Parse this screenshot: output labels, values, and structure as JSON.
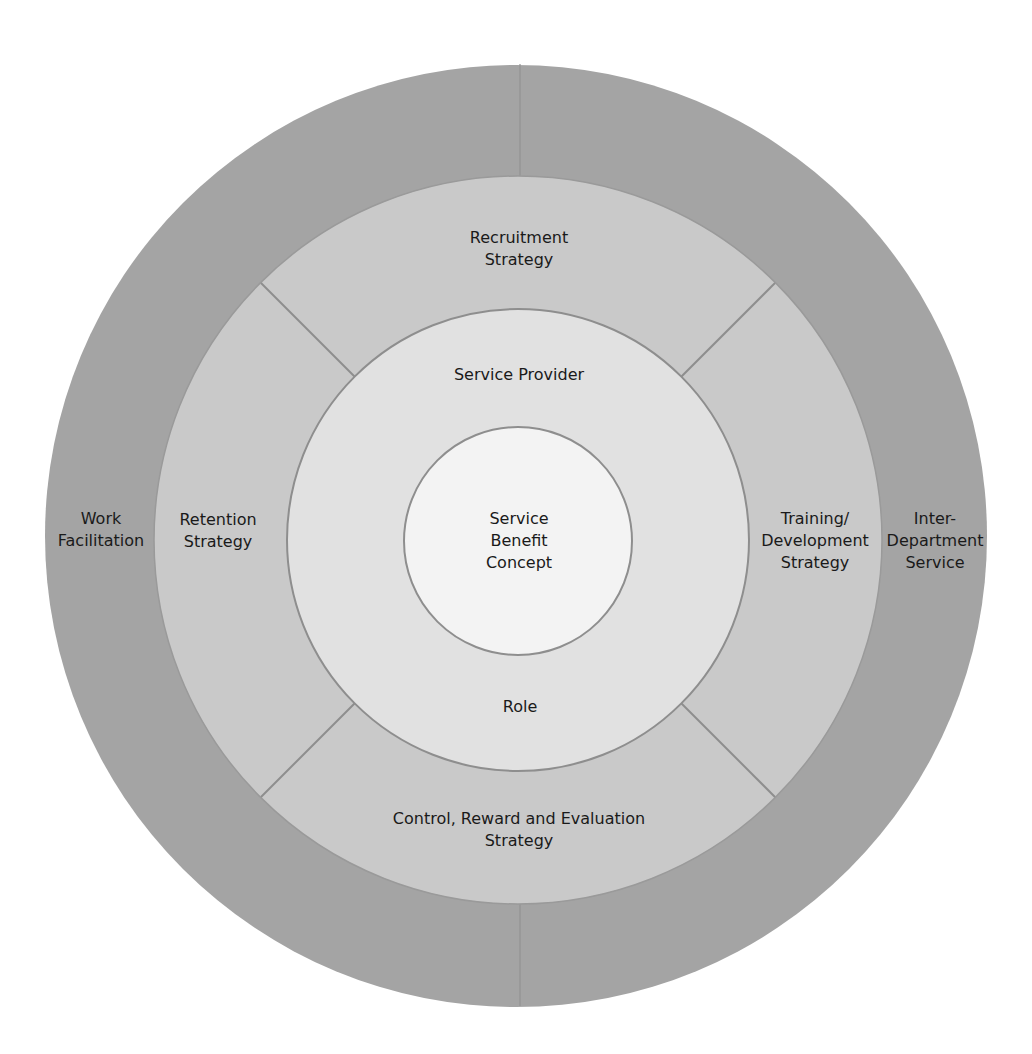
{
  "diagram": {
    "colors": {
      "background": "#ffffff",
      "outer_ring": "#a4a4a4",
      "middle_ring": "#c9c9c9",
      "inner_ring": "#e1e1e1",
      "core": "#f3f3f3",
      "stroke": "#8e8e8e",
      "text": "#1a1a1a"
    },
    "outer_ring": {
      "segments": [
        {
          "label": "Work\nFacilitation"
        },
        {
          "label": "Inter-\nDepartment\nService"
        }
      ]
    },
    "middle_ring": {
      "segments": [
        {
          "label": "Recruitment\nStrategy"
        },
        {
          "label": "Training/\nDevelopment\nStrategy"
        },
        {
          "label": "Control, Reward and Evaluation\nStrategy"
        },
        {
          "label": "Retention\nStrategy"
        }
      ]
    },
    "inner_ring": {
      "top_label": "Service Provider",
      "bottom_label": "Role"
    },
    "core": {
      "label": "Service\nBenefit\nConcept"
    }
  }
}
